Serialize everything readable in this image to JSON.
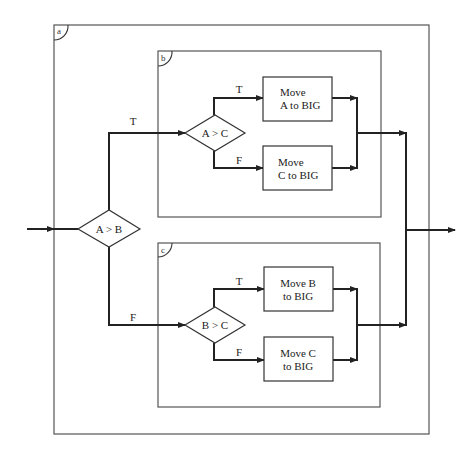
{
  "diagram": {
    "type": "nested structured flowchart (Nassi-style decision blocks)",
    "blocks": {
      "outer": {
        "tag": "a"
      },
      "upper": {
        "tag": "b"
      },
      "lower": {
        "tag": "c"
      }
    },
    "decisions": {
      "ab": {
        "label": "A > B",
        "true_label": "T",
        "false_label": "F"
      },
      "ac": {
        "label": "A > C",
        "true_label": "T",
        "false_label": "F"
      },
      "bc": {
        "label": "B > C",
        "true_label": "T",
        "false_label": "F"
      }
    },
    "processes": {
      "move_a": {
        "line1": "Move",
        "line2": "A to BIG"
      },
      "move_c1": {
        "line1": "Move",
        "line2": "C to BIG"
      },
      "move_b": {
        "line1": "Move B",
        "line2": "to BIG"
      },
      "move_c2": {
        "line1": "Move C",
        "line2": "to BIG"
      }
    },
    "colors": {
      "line": "#222222",
      "box": "#555555",
      "background": "#ffffff"
    }
  }
}
